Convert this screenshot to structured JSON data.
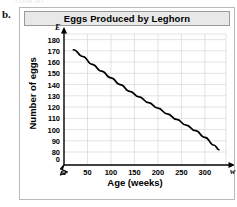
{
  "page": {
    "item_label": "b.",
    "top_artifact": "STEM 101"
  },
  "figure": {
    "title": "Eggs Produced by Leghorn"
  },
  "axes": {
    "y_variable_symbol": "E",
    "x_variable_symbol": "w",
    "y_break_symbol": "axis-break-zigzag",
    "y_origin_label": "0",
    "x_origin_label": "0"
  },
  "chart_data": {
    "type": "line",
    "title": "Eggs Produced by Leghorn",
    "xlabel": "Age (weeks)",
    "ylabel": "Number of eggs",
    "xlim": [
      0,
      345
    ],
    "ylim": [
      80,
      185
    ],
    "y_axis_broken": true,
    "y_break_between": [
      0,
      80
    ],
    "grid": true,
    "legend": null,
    "x_ticks": [
      0,
      50,
      100,
      150,
      200,
      250,
      300
    ],
    "x_tick_labels": [
      "0",
      "50",
      "100",
      "150",
      "200",
      "250",
      "300"
    ],
    "y_ticks": [
      80,
      90,
      100,
      110,
      120,
      130,
      140,
      150,
      160,
      170,
      180
    ],
    "y_tick_labels": [
      "80",
      "90",
      "100",
      "110",
      "120",
      "130",
      "140",
      "150",
      "160",
      "170",
      "180"
    ],
    "series": [
      {
        "name": "Eggs produced",
        "color": "#000000",
        "x": [
          20,
          40,
          60,
          80,
          100,
          120,
          140,
          160,
          180,
          200,
          220,
          240,
          260,
          280,
          300,
          320,
          330
        ],
        "values": [
          171,
          165,
          158,
          152,
          146,
          140,
          134,
          129,
          124,
          119,
          114,
          109,
          104,
          99,
          93,
          86,
          82
        ]
      }
    ]
  }
}
